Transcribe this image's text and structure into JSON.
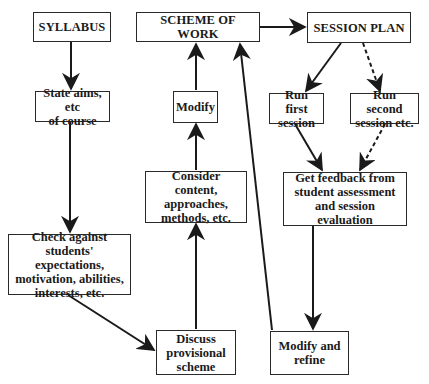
{
  "diagram": {
    "type": "flowchart",
    "nodes": {
      "syllabus": "SYLLABUS",
      "scheme_of_work": "SCHEME OF WORK",
      "session_plan": "SESSION PLAN",
      "state_aims": "State aims, etc\nof course",
      "modify": "Modify",
      "run_first": "Run first\nsession",
      "run_second": "Run second\nsession etc.",
      "consider_content": "Consider content,\napproaches,\nmethods, etc.",
      "get_feedback": "Get feedback from\nstudent assessment\nand session evaluation",
      "check_against": "Check against\nstudents' expectations,\nmotivation, abilities,\ninterests, etc.",
      "discuss_scheme": "Discuss\nprovisional\nscheme",
      "modify_refine": "Modify and\nrefine"
    },
    "edges": [
      {
        "from": "syllabus",
        "to": "state_aims",
        "style": "solid"
      },
      {
        "from": "state_aims",
        "to": "check_against",
        "style": "solid"
      },
      {
        "from": "check_against",
        "to": "discuss_scheme",
        "style": "solid"
      },
      {
        "from": "discuss_scheme",
        "to": "consider_content",
        "style": "solid"
      },
      {
        "from": "consider_content",
        "to": "modify",
        "style": "solid"
      },
      {
        "from": "modify",
        "to": "scheme_of_work",
        "style": "solid"
      },
      {
        "from": "scheme_of_work",
        "to": "session_plan",
        "style": "solid"
      },
      {
        "from": "session_plan",
        "to": "run_first",
        "style": "solid"
      },
      {
        "from": "session_plan",
        "to": "run_second",
        "style": "dashed"
      },
      {
        "from": "run_first",
        "to": "get_feedback",
        "style": "solid"
      },
      {
        "from": "run_second",
        "to": "get_feedback",
        "style": "dashed"
      },
      {
        "from": "get_feedback",
        "to": "modify_refine",
        "style": "solid"
      },
      {
        "from": "modify_refine",
        "to": "scheme_of_work",
        "style": "solid"
      }
    ],
    "colors": {
      "stroke": "#2a2a2a",
      "background": "#ffffff"
    }
  }
}
